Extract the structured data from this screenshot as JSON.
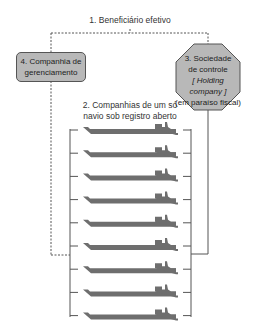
{
  "diagram": {
    "beneficiary": {
      "label": "1. Beneficiário efetivo"
    },
    "management_company": {
      "label_line1": "4. Companhia de",
      "label_line2": "gerenciamento"
    },
    "holding": {
      "line1": "3. Sociedade",
      "line2": "de controle",
      "line3": "[ Holding company ]",
      "line4": "(em paraíso fiscal)"
    },
    "single_ship_companies": {
      "label_line1": "2. Companhias de um só",
      "label_line2": "navio sob registro aberto",
      "ship_count": 9
    },
    "colors": {
      "box_fill": "#b8b8b8",
      "ship_fill": "#6e6e6e",
      "line": "#555555"
    }
  }
}
